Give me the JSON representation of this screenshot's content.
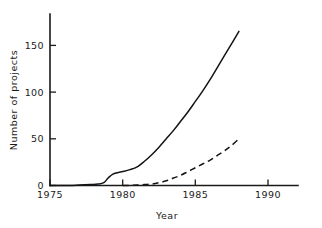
{
  "chart_data": {
    "type": "line",
    "title": "",
    "xlabel": "Year",
    "ylabel": "Number of projects",
    "xlim": [
      1975,
      1990
    ],
    "ylim": [
      0,
      175
    ],
    "grid": false,
    "legend": "none",
    "xticks": [
      1975,
      1980,
      1985,
      1990
    ],
    "xticklabels": [
      "1975",
      "1980",
      "1985",
      "1990"
    ],
    "yticks": [
      0,
      50,
      100,
      150
    ],
    "yticklabels": [
      "0",
      "50",
      "100",
      "150"
    ],
    "series": [
      {
        "name": "solid-curve",
        "style": "solid",
        "color": "#141414",
        "x": [
          1975.0,
          1976.0,
          1977.0,
          1977.8,
          1978.3,
          1978.7,
          1979.0,
          1979.3,
          1979.7,
          1980.0,
          1980.5,
          1981.0,
          1981.5,
          1982.0,
          1982.5,
          1983.0,
          1983.5,
          1984.0,
          1984.5,
          1985.0,
          1985.5,
          1986.0,
          1986.5,
          1987.0,
          1987.5,
          1988.0
        ],
        "y": [
          0,
          0,
          0.5,
          1,
          1.5,
          3,
          8,
          12,
          14,
          15,
          17,
          20,
          26,
          33,
          41,
          50,
          59,
          69,
          79,
          90,
          101,
          113,
          126,
          139,
          152,
          165
        ]
      },
      {
        "name": "dashed-curve",
        "style": "dashed",
        "color": "#141414",
        "x": [
          1980.0,
          1980.5,
          1981.0,
          1981.5,
          1982.0,
          1982.5,
          1983.0,
          1983.5,
          1984.0,
          1984.5,
          1985.0,
          1985.5,
          1986.0,
          1986.5,
          1987.0,
          1987.5,
          1988.0
        ],
        "y": [
          0,
          0,
          0.5,
          1,
          1.5,
          3,
          5,
          8,
          11,
          15,
          19,
          23,
          27,
          32,
          37,
          43,
          50
        ]
      }
    ]
  },
  "axes": {
    "ylabel_text": "Number of projects",
    "xlabel_text": "Year",
    "ytick_0": "0",
    "ytick_50": "50",
    "ytick_100": "100",
    "ytick_150": "150",
    "xtick_1975": "1975",
    "xtick_1980": "1980",
    "xtick_1985": "1985",
    "xtick_1990": "1990"
  }
}
